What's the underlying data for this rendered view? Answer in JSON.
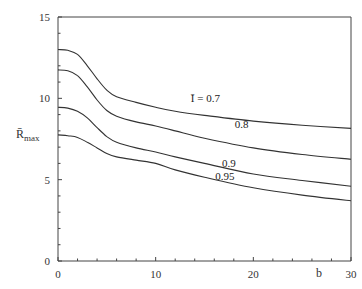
{
  "chart_data": {
    "type": "line",
    "title": "",
    "xlabel": "b",
    "ylabel": "R̄max",
    "ylabel_main": "R̄",
    "ylabel_sub": "max",
    "xlim": [
      0,
      30
    ],
    "ylim": [
      0,
      15
    ],
    "x_ticks": [
      0,
      10,
      20,
      30
    ],
    "x_tick_labels": [
      "0",
      "10",
      "20",
      "30"
    ],
    "x_minor_step": 2,
    "y_ticks": [
      0,
      5,
      10,
      15
    ],
    "y_tick_labels": [
      "0",
      "5",
      "10",
      "15"
    ],
    "y_minor_step": 1,
    "grid": false,
    "legend": "inline curve labels",
    "x": [
      0,
      1,
      2,
      3,
      4,
      5,
      6,
      8,
      10,
      12,
      15,
      20,
      25,
      30
    ],
    "series": [
      {
        "name": "Ī = 0.7",
        "label": "Ī = 0.7",
        "label_pos": [
          13.6,
          9.8
        ],
        "values": [
          13.0,
          12.95,
          12.7,
          12.0,
          11.2,
          10.5,
          10.1,
          9.75,
          9.45,
          9.2,
          8.95,
          8.6,
          8.35,
          8.15
        ]
      },
      {
        "name": "0.8",
        "label": "0.8",
        "label_pos": [
          18.1,
          8.15
        ],
        "values": [
          11.75,
          11.7,
          11.4,
          10.7,
          9.9,
          9.25,
          8.9,
          8.55,
          8.3,
          8.0,
          7.55,
          6.95,
          6.55,
          6.25
        ]
      },
      {
        "name": "0.9",
        "label": "0.9",
        "label_pos": [
          16.8,
          5.8
        ],
        "values": [
          9.45,
          9.4,
          9.2,
          8.8,
          8.2,
          7.65,
          7.3,
          6.95,
          6.7,
          6.4,
          6.0,
          5.35,
          4.95,
          4.6
        ]
      },
      {
        "name": "0.95",
        "label": "0.95",
        "label_pos": [
          16.1,
          4.95
        ],
        "values": [
          7.75,
          7.7,
          7.6,
          7.3,
          6.95,
          6.6,
          6.4,
          6.2,
          6.0,
          5.6,
          5.15,
          4.5,
          4.05,
          3.7
        ]
      }
    ]
  }
}
